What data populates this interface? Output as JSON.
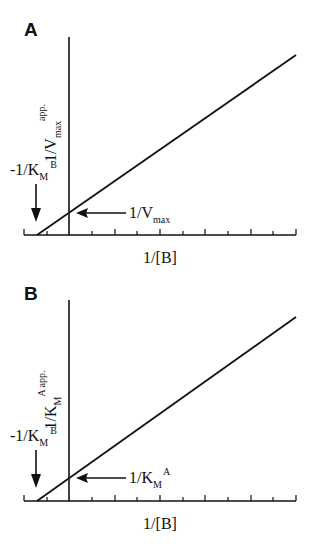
{
  "panels": [
    {
      "label": "A",
      "y_axis_label": {
        "main": "1/V",
        "sub": "max",
        "sup": "app."
      },
      "x_axis_label": "1/[B]",
      "intercept_x_label": {
        "main": "-1/K",
        "sub": "M",
        "sup": "B"
      },
      "intercept_y_label": {
        "main": "1/V",
        "sub": "max"
      }
    },
    {
      "label": "B",
      "y_axis_label": {
        "main": "1/K",
        "sub": "M",
        "sup": "A app."
      },
      "x_axis_label": "1/[B]",
      "intercept_x_label": {
        "main": "-1/K",
        "sub": "M",
        "sup": "B"
      },
      "intercept_y_label": {
        "main": "1/K",
        "sub": "M",
        "sup": "A"
      }
    }
  ],
  "colors": {
    "line": "#111111",
    "background": "#ffffff"
  }
}
